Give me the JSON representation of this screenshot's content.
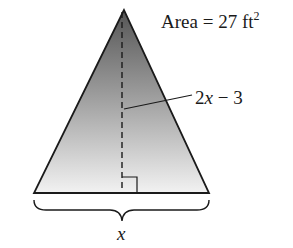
{
  "diagram": {
    "shape": "isosceles-triangle",
    "area_label": {
      "prefix": "Area = 27 ft",
      "superscript": "2"
    },
    "height_label": {
      "coefficient": "2",
      "variable": "x",
      "rest": " − 3"
    },
    "base_label": "x",
    "colors": {
      "outline": "#1a1a1a",
      "fill_top": "#5a5a5a",
      "fill_bottom": "#f2f2f2",
      "background": "#ffffff"
    }
  }
}
